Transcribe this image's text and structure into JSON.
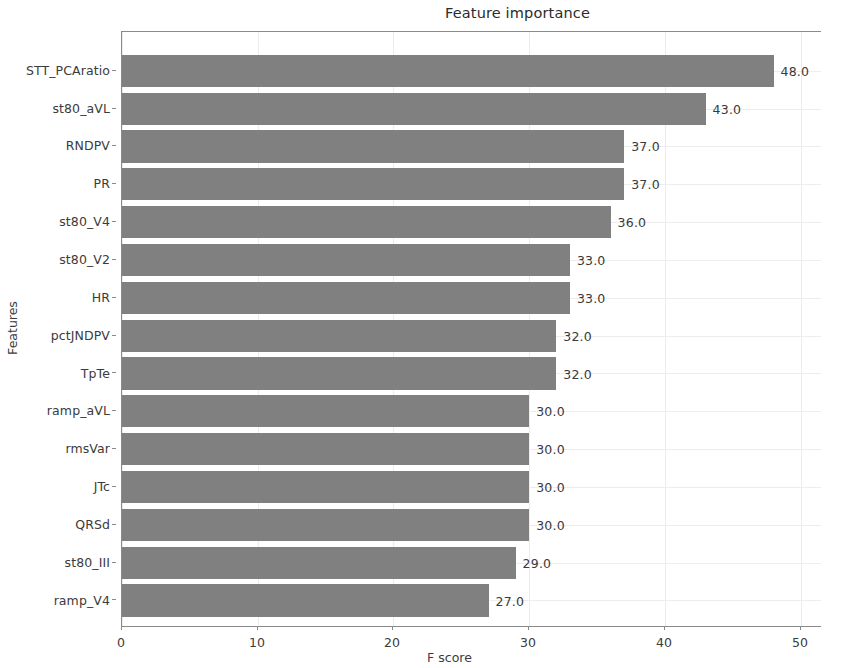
{
  "chart_data": {
    "type": "bar",
    "orientation": "horizontal",
    "title": "Feature importance",
    "xlabel": "F score",
    "ylabel": "Features",
    "categories": [
      "STT_PCAratio",
      "st80_aVL",
      "RNDPV",
      "PR",
      "st80_V4",
      "st80_V2",
      "HR",
      "pctJNDPV",
      "TpTe",
      "ramp_aVL",
      "rmsVar",
      "JTc",
      "QRSd",
      "st80_III",
      "ramp_V4"
    ],
    "values": [
      48,
      43,
      37,
      37,
      36,
      33,
      33,
      32,
      32,
      30,
      30,
      30,
      30,
      29,
      27
    ],
    "data_labels": [
      "48.0",
      "43.0",
      "37.0",
      "37.0",
      "36.0",
      "33.0",
      "33.0",
      "32.0",
      "32.0",
      "30.0",
      "30.0",
      "30.0",
      "30.0",
      "29.0",
      "27.0"
    ],
    "xlim": [
      0,
      51.5
    ],
    "xticks": [
      0,
      10,
      20,
      30,
      40,
      50
    ],
    "xtick_labels": [
      "0",
      "10",
      "20",
      "30",
      "40",
      "50"
    ],
    "grid": true,
    "legend": false,
    "bar_color": "#808080",
    "axis_color": "#8a8a8a",
    "grid_color": "#ececec",
    "text_color": "#3b3b3b"
  }
}
